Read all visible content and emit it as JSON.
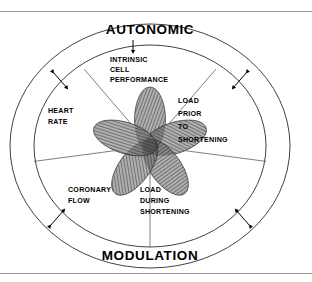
{
  "figure": {
    "kind": "radial-concept-diagram",
    "outer_ring_labels": {
      "top": "AUTONOMIC",
      "bottom": "MODULATION"
    },
    "sectors": [
      {
        "id": "intrinsic-cell-performance",
        "lines": [
          "INTRINSIC",
          "CELL",
          "PERFORMANCE"
        ],
        "angle_deg": 90
      },
      {
        "id": "load-prior-to-shortening",
        "lines": [
          "LOAD",
          "PRIOR",
          "TO",
          "SHORTENING"
        ],
        "angle_deg": 18
      },
      {
        "id": "load-during-shortening",
        "lines": [
          "LOAD",
          "DURING",
          "SHORTENING"
        ],
        "angle_deg": 306
      },
      {
        "id": "coronary-flow",
        "lines": [
          "CORONARY",
          "FLOW"
        ],
        "angle_deg": 234
      },
      {
        "id": "heart-rate",
        "lines": [
          "HEART",
          "RATE"
        ],
        "angle_deg": 162
      }
    ],
    "petal_count": 5,
    "arrows": {
      "top_label_arrow": "down-arrow",
      "ring_arrows": "double-headed-arrow",
      "ring_arrow_count": 4
    },
    "colors": {
      "ink": "#000000",
      "line": "#2b2b2b",
      "spoke": "#555555",
      "rule": "#9a9a9a",
      "background": "#ffffff",
      "petal_core": "#1a1a1a"
    }
  }
}
